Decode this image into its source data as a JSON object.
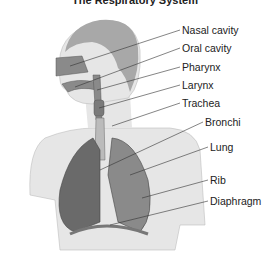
{
  "title": "The Respiratory System",
  "labels": [
    {
      "id": "nasal-cavity",
      "text": "Nasal cavity",
      "x": 182,
      "y": 24
    },
    {
      "id": "oral-cavity",
      "text": "Oral cavity",
      "x": 182,
      "y": 42
    },
    {
      "id": "pharynx",
      "text": "Pharynx",
      "x": 182,
      "y": 61
    },
    {
      "id": "larynx",
      "text": "Larynx",
      "x": 182,
      "y": 79
    },
    {
      "id": "trachea",
      "text": "Trachea",
      "x": 182,
      "y": 97
    },
    {
      "id": "bronchi",
      "text": "Bronchi",
      "x": 205,
      "y": 116
    },
    {
      "id": "lung",
      "text": "Lung",
      "x": 210,
      "y": 141
    },
    {
      "id": "rib",
      "text": "Rib",
      "x": 210,
      "y": 174
    },
    {
      "id": "diaphragm",
      "text": "Diaphragm",
      "x": 210,
      "y": 195
    }
  ],
  "colors": {
    "skin": "#e6e6e6",
    "hair": "#a8a8a8",
    "organ": "#8a8a8a",
    "organ_dark": "#6a6a6a",
    "line": "#333333"
  }
}
